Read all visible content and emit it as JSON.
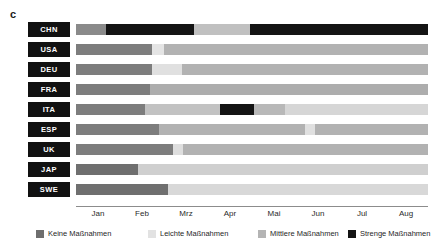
{
  "panel": {
    "label": "c"
  },
  "chart_data": {
    "type": "bar",
    "orientation": "horizontal-stacked-timeline",
    "title": "",
    "subtitle": "",
    "xlabel": "",
    "ylabel": "",
    "grid": false,
    "legend_position": "bottom",
    "x_axis": {
      "tick_labels": [
        "Jan",
        "Feb",
        "Mrz",
        "Apr",
        "Mai",
        "Jun",
        "Jul",
        "Aug"
      ],
      "tick_positions_pct": [
        6.25,
        18.75,
        31.25,
        43.75,
        56.25,
        68.75,
        81.25,
        93.75
      ],
      "range_start": "Jan",
      "range_end": "Aug"
    },
    "categories": [
      "CHN",
      "USA",
      "DEU",
      "FRA",
      "ITA",
      "ESP",
      "UK",
      "JAP",
      "SWE"
    ],
    "legend": [
      {
        "key": "keine",
        "label": "Keine Maßnahmen",
        "color": "#6e6e6e"
      },
      {
        "key": "leichte",
        "label": "Leichte Maßnahmen",
        "color": "#e2e2e2"
      },
      {
        "key": "mittlere",
        "label": "Mittlere Maßnahmen",
        "color": "#b4b4b4"
      },
      {
        "key": "strenge",
        "label": "Strenge Maßnahmen",
        "color": "#141414"
      }
    ],
    "series": [
      {
        "name": "CHN",
        "segments": [
          {
            "level": "keine",
            "start_pct": 0.0,
            "end_pct": 8.5,
            "color": "#8a8a8a"
          },
          {
            "level": "strenge",
            "start_pct": 8.5,
            "end_pct": 33.5,
            "color": "#141414"
          },
          {
            "level": "mittlere",
            "start_pct": 33.5,
            "end_pct": 49.5,
            "color": "#c0c0c0"
          },
          {
            "level": "strenge",
            "start_pct": 49.5,
            "end_pct": 100.0,
            "color": "#141414"
          }
        ]
      },
      {
        "name": "USA",
        "segments": [
          {
            "level": "keine",
            "start_pct": 0.0,
            "end_pct": 21.5,
            "color": "#7d7d7d"
          },
          {
            "level": "leichte",
            "start_pct": 21.5,
            "end_pct": 25.0,
            "color": "#e4e4e4"
          },
          {
            "level": "mittlere",
            "start_pct": 25.0,
            "end_pct": 100.0,
            "color": "#b2b2b2"
          }
        ]
      },
      {
        "name": "DEU",
        "segments": [
          {
            "level": "keine",
            "start_pct": 0.0,
            "end_pct": 21.5,
            "color": "#7d7d7d"
          },
          {
            "level": "leichte",
            "start_pct": 21.5,
            "end_pct": 30.0,
            "color": "#e0e0e0"
          },
          {
            "level": "mittlere",
            "start_pct": 30.0,
            "end_pct": 100.0,
            "color": "#b2b2b2"
          }
        ]
      },
      {
        "name": "FRA",
        "segments": [
          {
            "level": "keine",
            "start_pct": 0.0,
            "end_pct": 21.0,
            "color": "#7d7d7d"
          },
          {
            "level": "mittlere",
            "start_pct": 21.0,
            "end_pct": 100.0,
            "color": "#adadad"
          }
        ]
      },
      {
        "name": "ITA",
        "segments": [
          {
            "level": "keine",
            "start_pct": 0.0,
            "end_pct": 19.5,
            "color": "#7d7d7d"
          },
          {
            "level": "mittlere",
            "start_pct": 19.5,
            "end_pct": 41.0,
            "color": "#c2c2c2"
          },
          {
            "level": "strenge",
            "start_pct": 41.0,
            "end_pct": 50.5,
            "color": "#141414"
          },
          {
            "level": "mittlere",
            "start_pct": 50.5,
            "end_pct": 59.5,
            "color": "#b8b8b8"
          },
          {
            "level": "leichte",
            "start_pct": 59.5,
            "end_pct": 100.0,
            "color": "#d6d6d6"
          }
        ]
      },
      {
        "name": "ESP",
        "segments": [
          {
            "level": "keine",
            "start_pct": 0.0,
            "end_pct": 23.5,
            "color": "#7d7d7d"
          },
          {
            "level": "mittlere",
            "start_pct": 23.5,
            "end_pct": 65.0,
            "color": "#b2b2b2"
          },
          {
            "level": "leichte",
            "start_pct": 65.0,
            "end_pct": 68.0,
            "color": "#e0e0e0"
          },
          {
            "level": "mittlere",
            "start_pct": 68.0,
            "end_pct": 100.0,
            "color": "#b2b2b2"
          }
        ]
      },
      {
        "name": "UK",
        "segments": [
          {
            "level": "keine",
            "start_pct": 0.0,
            "end_pct": 27.5,
            "color": "#7d7d7d"
          },
          {
            "level": "leichte",
            "start_pct": 27.5,
            "end_pct": 30.5,
            "color": "#dedede"
          },
          {
            "level": "mittlere",
            "start_pct": 30.5,
            "end_pct": 100.0,
            "color": "#b2b2b2"
          }
        ]
      },
      {
        "name": "JAP",
        "segments": [
          {
            "level": "keine",
            "start_pct": 0.0,
            "end_pct": 17.5,
            "color": "#6f6f6f"
          },
          {
            "level": "leichte",
            "start_pct": 17.5,
            "end_pct": 100.0,
            "color": "#cfcfcf"
          }
        ]
      },
      {
        "name": "SWE",
        "segments": [
          {
            "level": "keine",
            "start_pct": 0.0,
            "end_pct": 26.0,
            "color": "#6f6f6f"
          },
          {
            "level": "leichte",
            "start_pct": 26.0,
            "end_pct": 100.0,
            "color": "#d8d8d8"
          }
        ]
      }
    ]
  }
}
